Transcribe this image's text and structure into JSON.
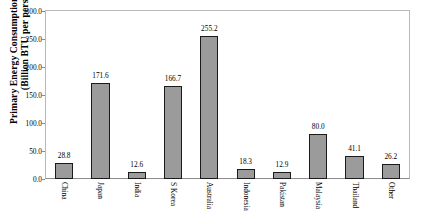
{
  "chart_data": {
    "type": "bar",
    "title": "",
    "xlabel": "",
    "ylabel_line1": "Primary Energy Consumption per capita",
    "ylabel_line2": "(Billion BTU per person)",
    "categories": [
      "China",
      "Japan",
      "India",
      "S Korea",
      "Australia",
      "Indonesia",
      "Pakistan",
      "Malaysia",
      "Thailand",
      "Other"
    ],
    "values": [
      28.8,
      171.6,
      12.6,
      166.7,
      255.2,
      18.3,
      12.9,
      80.0,
      41.1,
      26.2
    ],
    "value_labels": [
      "28.8",
      "171.6",
      "12.6",
      "166.7",
      "255.2",
      "18.3",
      "12.9",
      "80.0",
      "41.1",
      "26.2"
    ],
    "ylim": [
      0,
      300
    ],
    "ytick_values": [
      0,
      50,
      100,
      150,
      200,
      250,
      300
    ],
    "ytick_labels": [
      "0.0",
      "50.0",
      "100.0",
      "150.0",
      "200.0",
      "250.0",
      "300.0"
    ],
    "grid": false,
    "legend": false,
    "bar_color": "#9b9b9b",
    "bar_border_color": "#1a1a1a",
    "axis_color": "#8d8d8d",
    "text_color": "#000000"
  }
}
